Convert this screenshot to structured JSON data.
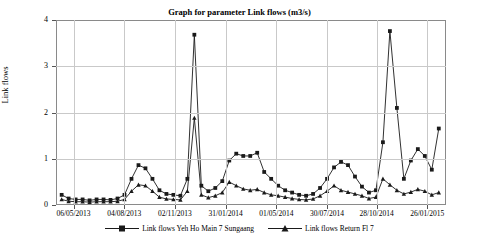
{
  "chart_data": {
    "type": "line",
    "title": "Graph for parameter Link flows (m3/s)",
    "xlabel": "",
    "ylabel": "Link flows",
    "ylim": [
      0,
      4
    ],
    "yticks": [
      0,
      1,
      2,
      3,
      4
    ],
    "ytick_labels": [
      "0",
      "1",
      "2",
      "3",
      "4"
    ],
    "grid": true,
    "legend_position": "bottom",
    "xtick_labels": [
      "06/05/2013",
      "04/08/2013",
      "02/11/2013",
      "31/01/2014",
      "01/05/2014",
      "30/07/2014",
      "28/10/2014",
      "26/01/2015"
    ],
    "xtick_positions": [
      0.045,
      0.175,
      0.305,
      0.435,
      0.565,
      0.695,
      0.822,
      0.952
    ],
    "series": [
      {
        "name": "Link flows Yeh Ho Main 7 Sungaang",
        "marker": "square",
        "color": "#1a1a1a",
        "x": [
          0.012,
          0.03,
          0.048,
          0.066,
          0.084,
          0.102,
          0.12,
          0.138,
          0.156,
          0.174,
          0.192,
          0.21,
          0.228,
          0.246,
          0.264,
          0.282,
          0.3,
          0.318,
          0.336,
          0.354,
          0.372,
          0.39,
          0.408,
          0.426,
          0.444,
          0.462,
          0.48,
          0.498,
          0.516,
          0.534,
          0.552,
          0.57,
          0.588,
          0.606,
          0.624,
          0.642,
          0.66,
          0.678,
          0.696,
          0.714,
          0.732,
          0.75,
          0.768,
          0.786,
          0.804,
          0.822,
          0.84,
          0.858,
          0.876,
          0.894,
          0.912,
          0.93,
          0.948,
          0.966,
          0.984
        ],
        "values": [
          0.2,
          0.12,
          0.1,
          0.1,
          0.08,
          0.1,
          0.1,
          0.09,
          0.12,
          0.2,
          0.55,
          0.85,
          0.78,
          0.55,
          0.3,
          0.22,
          0.2,
          0.18,
          0.55,
          3.7,
          0.4,
          0.28,
          0.35,
          0.5,
          0.95,
          1.1,
          1.05,
          1.05,
          1.12,
          0.7,
          0.55,
          0.4,
          0.3,
          0.25,
          0.2,
          0.18,
          0.22,
          0.35,
          0.55,
          0.8,
          0.92,
          0.85,
          0.6,
          0.38,
          0.25,
          0.3,
          1.35,
          3.78,
          2.1,
          0.55,
          0.95,
          1.2,
          1.05,
          0.75,
          1.65
        ]
      },
      {
        "name": "Link flows Return Fl 7",
        "marker": "triangle",
        "color": "#1a1a1a",
        "x": [
          0.012,
          0.03,
          0.048,
          0.066,
          0.084,
          0.102,
          0.12,
          0.138,
          0.156,
          0.174,
          0.192,
          0.21,
          0.228,
          0.246,
          0.264,
          0.282,
          0.3,
          0.318,
          0.336,
          0.354,
          0.372,
          0.39,
          0.408,
          0.426,
          0.444,
          0.462,
          0.48,
          0.498,
          0.516,
          0.534,
          0.552,
          0.57,
          0.588,
          0.606,
          0.624,
          0.642,
          0.66,
          0.678,
          0.696,
          0.714,
          0.732,
          0.75,
          0.768,
          0.786,
          0.804,
          0.822,
          0.84,
          0.858,
          0.876,
          0.894,
          0.912,
          0.93,
          0.948,
          0.966,
          0.984
        ],
        "values": [
          0.1,
          0.06,
          0.05,
          0.05,
          0.04,
          0.05,
          0.05,
          0.05,
          0.06,
          0.1,
          0.28,
          0.42,
          0.4,
          0.28,
          0.15,
          0.11,
          0.1,
          0.09,
          0.28,
          1.88,
          0.2,
          0.14,
          0.18,
          0.25,
          0.48,
          0.4,
          0.33,
          0.3,
          0.32,
          0.25,
          0.2,
          0.18,
          0.15,
          0.12,
          0.1,
          0.09,
          0.11,
          0.18,
          0.28,
          0.4,
          0.3,
          0.26,
          0.22,
          0.18,
          0.12,
          0.15,
          0.55,
          0.42,
          0.3,
          0.22,
          0.26,
          0.32,
          0.28,
          0.2,
          0.25
        ]
      }
    ]
  },
  "legend": {
    "items": [
      {
        "label": "Link flows Yeh Ho Main 7 Sungaang",
        "marker": "square"
      },
      {
        "label": "Link flows Return Fl 7",
        "marker": "triangle"
      }
    ]
  }
}
